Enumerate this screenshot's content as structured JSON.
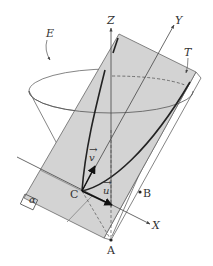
{
  "diagram": {
    "title": "",
    "colors": {
      "plane_fill": "#d3d3d3",
      "stroke": "#555555",
      "heavy_stroke": "#222222",
      "text": "#333333",
      "background": "#ffffff"
    },
    "labels": {
      "cone": "E",
      "tangent_plane": "T",
      "plane": "α",
      "z_axis": "Z",
      "y_axis": "Y",
      "x_axis": "X",
      "vertex": "C",
      "point_a": "A",
      "point_b": "B",
      "vector_u": "u",
      "vector_v": "v",
      "vector_arrow": "→"
    },
    "points": {
      "C": [
        82,
        191
      ],
      "A": [
        111,
        240
      ],
      "B": [
        140,
        192
      ]
    }
  }
}
